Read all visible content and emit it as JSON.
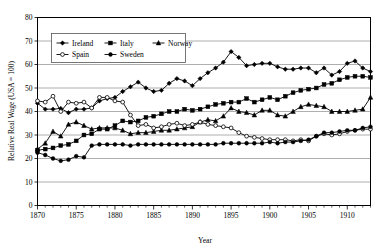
{
  "chart_data": {
    "type": "line",
    "title": "",
    "xlabel": "Year",
    "ylabel": "Relative Real Wage (USA = 100)",
    "xlim": [
      1870,
      1913
    ],
    "ylim": [
      0,
      80
    ],
    "ytick_step": 10,
    "xtick_step": 5,
    "grid": true,
    "legend_position": "top-left-inside",
    "xticks": [
      "1870",
      "1875",
      "1880",
      "1885",
      "1890",
      "1895",
      "1900",
      "1905",
      "1910"
    ],
    "yticks": [
      "0",
      "10",
      "20",
      "30",
      "40",
      "50",
      "60",
      "70",
      "80"
    ],
    "x": [
      1870,
      1871,
      1872,
      1873,
      1874,
      1875,
      1876,
      1877,
      1878,
      1879,
      1880,
      1881,
      1882,
      1883,
      1884,
      1885,
      1886,
      1887,
      1888,
      1889,
      1890,
      1891,
      1892,
      1893,
      1894,
      1895,
      1896,
      1897,
      1898,
      1899,
      1900,
      1901,
      1902,
      1903,
      1904,
      1905,
      1906,
      1907,
      1908,
      1909,
      1910,
      1911,
      1912,
      1913
    ],
    "series": [
      {
        "name": "Ireland",
        "marker": "diamond",
        "values": [
          43.5,
          41.0,
          41.0,
          41.3,
          39.5,
          41.0,
          41.0,
          41.5,
          44.5,
          45.5,
          46.0,
          48.5,
          50.5,
          52.5,
          50.0,
          48.5,
          49.0,
          52.0,
          54.0,
          53.0,
          51.0,
          54.0,
          56.5,
          58.5,
          61.0,
          65.5,
          63.0,
          59.5,
          60.0,
          60.5,
          60.5,
          59.0,
          58.0,
          58.0,
          58.5,
          58.5,
          56.5,
          58.5,
          55.5,
          57.0,
          60.5,
          61.5,
          58.5,
          57.0
        ]
      },
      {
        "name": "Italy",
        "marker": "square",
        "values": [
          23.5,
          24.0,
          24.5,
          25.5,
          26.0,
          27.5,
          30.0,
          30.5,
          32.5,
          32.5,
          34.0,
          36.0,
          35.5,
          36.0,
          37.5,
          38.0,
          39.0,
          40.0,
          40.0,
          41.0,
          40.5,
          41.0,
          42.0,
          43.0,
          43.5,
          44.0,
          44.0,
          45.5,
          44.0,
          45.0,
          46.0,
          45.0,
          46.5,
          48.0,
          49.0,
          49.5,
          50.0,
          51.5,
          52.0,
          53.5,
          54.5,
          55.0,
          55.0,
          54.5
        ]
      },
      {
        "name": "Norway",
        "marker": "triangle",
        "values": [
          24.0,
          26.5,
          31.5,
          29.5,
          34.5,
          35.5,
          34.0,
          32.5,
          33.0,
          33.0,
          33.0,
          32.0,
          30.5,
          31.0,
          31.0,
          31.5,
          32.0,
          32.0,
          32.5,
          33.0,
          33.5,
          35.5,
          36.5,
          36.0,
          38.0,
          41.5,
          40.0,
          39.5,
          38.5,
          40.5,
          40.5,
          38.5,
          38.0,
          40.0,
          42.0,
          43.0,
          42.5,
          42.0,
          40.0,
          40.0,
          40.0,
          40.5,
          41.0,
          46.0
        ]
      },
      {
        "name": "Spain",
        "marker": "open-circle",
        "values": [
          44.5,
          44.0,
          46.5,
          40.0,
          44.0,
          43.5,
          44.0,
          41.5,
          46.0,
          46.0,
          44.5,
          44.0,
          38.5,
          34.0,
          34.5,
          33.0,
          33.5,
          34.5,
          35.0,
          34.0,
          34.5,
          35.5,
          34.5,
          34.0,
          33.5,
          33.0,
          31.0,
          29.5,
          29.0,
          28.5,
          28.0,
          28.0,
          28.0,
          27.5,
          28.0,
          27.5,
          29.5,
          30.5,
          30.0,
          30.5,
          31.5,
          32.0,
          32.5,
          32.5
        ]
      },
      {
        "name": "Sweden",
        "marker": "circle",
        "values": [
          22.5,
          21.5,
          20.0,
          19.0,
          19.5,
          21.0,
          20.5,
          25.5,
          26.0,
          26.0,
          26.0,
          26.0,
          25.5,
          26.0,
          26.0,
          26.0,
          26.0,
          26.0,
          26.0,
          26.0,
          26.0,
          26.0,
          26.0,
          26.0,
          26.5,
          26.5,
          26.5,
          26.5,
          26.5,
          26.5,
          27.0,
          26.5,
          27.0,
          27.0,
          27.5,
          28.0,
          29.5,
          31.0,
          31.0,
          31.5,
          32.0,
          32.0,
          33.0,
          33.5
        ]
      }
    ]
  },
  "legend": {
    "entries": [
      {
        "label": "Ireland"
      },
      {
        "label": "Italy"
      },
      {
        "label": "Norway"
      },
      {
        "label": "Spain"
      },
      {
        "label": "Sweden"
      }
    ]
  },
  "colors": {
    "series": "#000000",
    "grid": "#9a9a9a",
    "axis": "#000000",
    "background": "#ffffff"
  }
}
